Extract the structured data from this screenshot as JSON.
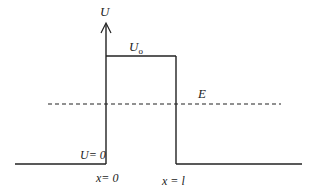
{
  "diagram": {
    "labels": {
      "y_axis": "U",
      "barrier_height": "U",
      "barrier_height_sub": "o",
      "energy": "E",
      "zero_potential": "U= 0",
      "left_edge": "x= 0",
      "right_edge": "x = l"
    },
    "colors": {
      "line": "#222222",
      "background": "#ffffff"
    }
  }
}
